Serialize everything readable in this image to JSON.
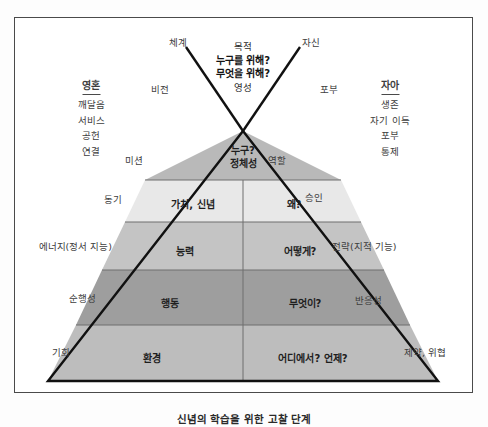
{
  "diagram": {
    "apex": {
      "left_branch_label": "체계",
      "right_branch_label": "자신",
      "center_lines": [
        "목적",
        "누구를 위해?",
        "무엇을 위해?",
        "영성"
      ],
      "left_inner_label": "비전",
      "right_inner_label": "포부"
    },
    "left_column": {
      "heading": "영혼",
      "items": [
        "깨달음",
        "서비스",
        "공헌",
        "연결"
      ]
    },
    "right_column": {
      "heading": "자아",
      "items": [
        "생존",
        "자기 이득",
        "포부",
        "통제"
      ]
    },
    "tiers": [
      {
        "id": "identity",
        "left_outer": "미션",
        "right_outer": "역할",
        "left_cell": "누구?\n정체성",
        "left_cell_line1": "누구?",
        "left_cell_line2": "정체성",
        "right_cell": "",
        "fill": "#b9b9b9"
      },
      {
        "id": "values",
        "left_outer": "동기",
        "right_outer": "승인",
        "left_cell": "가치, 신념",
        "right_cell": "왜?",
        "fill": "#e8e8e8"
      },
      {
        "id": "capability",
        "left_outer": "에너지(정서 지능)",
        "right_outer": "전략(지적 기능)",
        "left_cell": "능력",
        "right_cell": "어떻게?",
        "fill": "#c4c4c4"
      },
      {
        "id": "behaviour",
        "left_outer": "순행성",
        "right_outer": "반응성",
        "left_cell": "행동",
        "right_cell": "무엇이?",
        "fill": "#9e9e9e"
      },
      {
        "id": "environment",
        "left_outer": "기회",
        "right_outer": "제약, 위협",
        "left_cell": "환경",
        "right_cell": "어디에서? 언제?",
        "fill": "#bdbdbd"
      }
    ],
    "caption": "신념의 학습을 위한 고찰 단계",
    "colors": {
      "outline": "#111111",
      "divider": "#6e6e6e",
      "frame": "#4a4a4a",
      "text": "#3d3d3d"
    }
  }
}
